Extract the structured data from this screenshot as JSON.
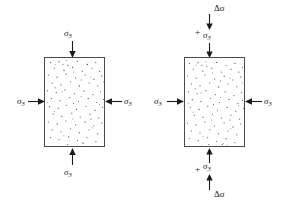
{
  "figure": {
    "type": "engineering-diagram",
    "background_color": "#ffffff",
    "line_color": "#4a4a4a",
    "text_color": "#171717"
  },
  "symbols": {
    "sigma": "σ",
    "sigma3_main": "σ",
    "sigma3_sub": "3",
    "delta_sigma": "Δσ",
    "plus": "+"
  },
  "panels": [
    {
      "id": "left-panel",
      "name": "isotropic-confining-stress-state",
      "specimen": {
        "x": 44,
        "y": 57,
        "width": 61,
        "height": 90
      },
      "labels": {
        "top": "σ",
        "top_sub": "3",
        "bottom": "σ",
        "bottom_sub": "3",
        "left": "σ",
        "left_sub": "3",
        "right": "σ",
        "right_sub": "3"
      }
    },
    {
      "id": "right-panel",
      "name": "deviator-stress-state",
      "specimen": {
        "x": 184,
        "y": 57,
        "width": 61,
        "height": 90
      },
      "labels": {
        "top_delta": "Δσ",
        "top_plus": "+",
        "top_sigma": "σ",
        "top_sigma_sub": "3",
        "bottom_delta": "Δσ",
        "bottom_plus": "+",
        "bottom_sigma": "σ",
        "bottom_sigma_sub": "3",
        "left": "σ",
        "left_sub": "3",
        "right": "σ",
        "right_sub": "3"
      }
    }
  ]
}
